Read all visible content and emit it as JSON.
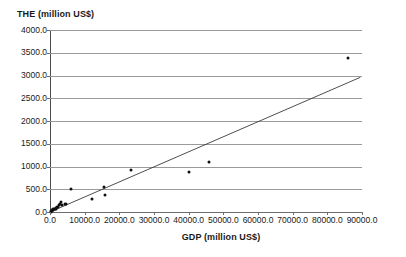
{
  "chart_data": {
    "type": "scatter",
    "title": "",
    "xlabel": "GDP (million US$)",
    "ylabel": "THE (million US$)",
    "xlim": [
      0,
      90000
    ],
    "ylim": [
      0,
      4000
    ],
    "grid": true,
    "legend": false,
    "x_ticks": [
      0,
      10000,
      20000,
      30000,
      40000,
      50000,
      60000,
      70000,
      80000,
      90000
    ],
    "x_tick_labels": [
      "0.0",
      "10000.0",
      "20000.0",
      "30000.0",
      "40000.0",
      "50000.0",
      "60000.0",
      "70000.0",
      "80000.0",
      "90000.0"
    ],
    "y_ticks": [
      0,
      500,
      1000,
      1500,
      2000,
      2500,
      3000,
      3500,
      4000
    ],
    "y_tick_labels": [
      "0.0",
      "500.0",
      "1000.0",
      "1500.0",
      "2000.0",
      "2500.0",
      "3000.0",
      "3500.0",
      "4000.0"
    ],
    "series": [
      {
        "name": "Countries",
        "marker": "filled-circle",
        "color": "#101010",
        "points": [
          {
            "x": 200,
            "y": 10
          },
          {
            "x": 350,
            "y": 18
          },
          {
            "x": 500,
            "y": 25
          },
          {
            "x": 700,
            "y": 35
          },
          {
            "x": 850,
            "y": 45
          },
          {
            "x": 1000,
            "y": 55
          },
          {
            "x": 1200,
            "y": 60
          },
          {
            "x": 1400,
            "y": 75
          },
          {
            "x": 1600,
            "y": 70
          },
          {
            "x": 1800,
            "y": 95
          },
          {
            "x": 2000,
            "y": 110
          },
          {
            "x": 2300,
            "y": 120
          },
          {
            "x": 2600,
            "y": 150
          },
          {
            "x": 2900,
            "y": 175
          },
          {
            "x": 3100,
            "y": 230
          },
          {
            "x": 3600,
            "y": 150
          },
          {
            "x": 4200,
            "y": 175
          },
          {
            "x": 4600,
            "y": 185
          },
          {
            "x": 6000,
            "y": 510
          },
          {
            "x": 12000,
            "y": 290
          },
          {
            "x": 15500,
            "y": 545
          },
          {
            "x": 16000,
            "y": 365
          },
          {
            "x": 23500,
            "y": 930
          },
          {
            "x": 40000,
            "y": 880
          },
          {
            "x": 46000,
            "y": 1100
          },
          {
            "x": 86000,
            "y": 3390
          }
        ]
      }
    ],
    "trendline": {
      "type": "linear",
      "color": "#3a3a3a",
      "x_start": 0,
      "y_start": 0,
      "x_end": 89500,
      "y_end": 2960
    }
  }
}
